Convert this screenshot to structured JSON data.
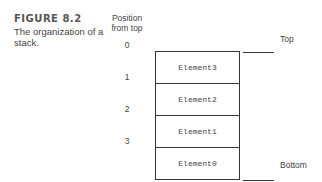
{
  "figure": {
    "label": "FIGURE 8.2",
    "caption": "The organization of a stack."
  },
  "position_header": "Position from top",
  "positions": [
    "0",
    "1",
    "2",
    "3"
  ],
  "stack": {
    "elements": [
      "Element3",
      "Element2",
      "Element1",
      "Element0"
    ]
  },
  "markers": {
    "top": "Top",
    "bottom": "Bottom"
  }
}
